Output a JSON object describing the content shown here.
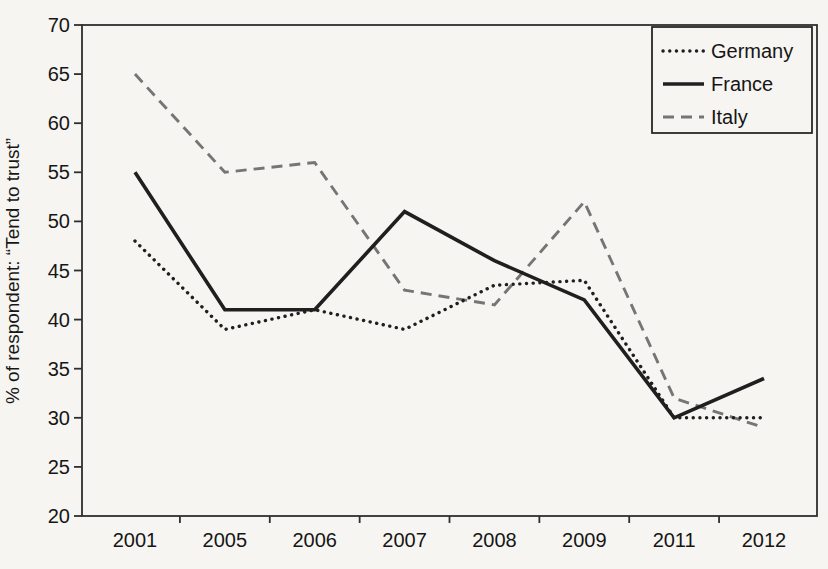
{
  "figure": {
    "background_color": "#f6f5f1",
    "axis_color": "#2f2f2f",
    "text_color": "#161616",
    "legend_border_color": "#1c1c1c"
  },
  "chart_data": {
    "type": "line",
    "title": "",
    "xlabel": "",
    "ylabel": "% of respondent: “Tend to trust”",
    "categories": [
      "2001",
      "2005",
      "2006",
      "2007",
      "2008",
      "2009",
      "2011",
      "2012"
    ],
    "series": [
      {
        "name": "Germany",
        "line_style": "dotted",
        "color": "#1f1f1f",
        "values": [
          48,
          39,
          41,
          39,
          43.5,
          44,
          30,
          30
        ]
      },
      {
        "name": "France",
        "line_style": "solid",
        "color": "#1f1f1f",
        "values": [
          55,
          41,
          41,
          51,
          46,
          42,
          30,
          34
        ]
      },
      {
        "name": "Italy",
        "line_style": "dashed",
        "color": "#757575",
        "values": [
          65,
          55,
          56,
          43,
          41.5,
          52,
          32,
          29
        ]
      }
    ],
    "ylim": [
      20,
      70
    ],
    "yticks": [
      20,
      25,
      30,
      35,
      40,
      45,
      50,
      55,
      60,
      65,
      70
    ],
    "grid": false,
    "legend_position": "top-right",
    "legend_entries": [
      "Germany",
      "France",
      "Italy"
    ]
  }
}
